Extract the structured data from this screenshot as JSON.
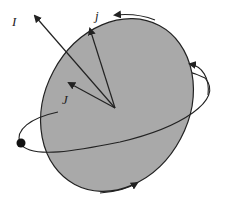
{
  "diagram": {
    "labels": {
      "vector_I": "I",
      "vector_j": "j",
      "vector_J": "J"
    },
    "colors": {
      "body_fill": "#a9a9a9",
      "stroke": "#222222",
      "background": "#ffffff"
    },
    "elements": [
      "tilted-ellipsoid-body",
      "orbit-ellipse",
      "orbiting-point-mass",
      "vector-I",
      "vector-j",
      "vector-J",
      "rotation-arrows"
    ]
  }
}
